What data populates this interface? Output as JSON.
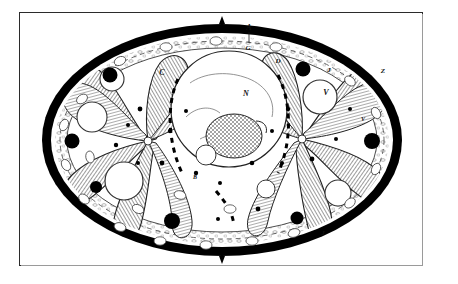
{
  "plate": {
    "domain_note": "engraved histological cross-section plate",
    "background_color": "#ffffff",
    "frame_color": "#2b2b2b",
    "ink_color": "#111111"
  },
  "figure": {
    "title": "",
    "specimen_outline": "oval transverse section with thick black cuticle ring",
    "cuticle_color": "#000000",
    "hatching_color": "#555555",
    "vacuole_fill": "#ffffff",
    "granule_fill": "#000000"
  },
  "labels": [
    {
      "id": "label-a",
      "text": "A",
      "x": 229,
      "y": 17
    },
    {
      "id": "label-g",
      "text": "G",
      "x": 228,
      "y": 37
    },
    {
      "id": "label-d",
      "text": "D",
      "x": 258,
      "y": 50
    },
    {
      "id": "label-c",
      "text": "C",
      "x": 142,
      "y": 62
    },
    {
      "id": "label-n",
      "text": "N",
      "x": 226,
      "y": 83
    },
    {
      "id": "label-v",
      "text": "V",
      "x": 306,
      "y": 82
    },
    {
      "id": "label-z",
      "text": "Z",
      "x": 363,
      "y": 60
    },
    {
      "id": "label-v2",
      "text": "V",
      "x": 343,
      "y": 108
    },
    {
      "id": "label-j",
      "text": "J",
      "x": 309,
      "y": 59
    },
    {
      "id": "label-j2",
      "text": "J",
      "x": 303,
      "y": 222
    },
    {
      "id": "label-b",
      "text": "B",
      "x": 175,
      "y": 166
    }
  ],
  "structures": {
    "central_organ": "large circular body containing nucleus N and stippled corpuscle",
    "radial_muscles": "eight to ten hatched radiating muscle bands",
    "peripheral_granules": "ring of solid black granules inside the cuticle",
    "vacuoles": "large clear round vacuoles distributed in the parenchyma"
  }
}
